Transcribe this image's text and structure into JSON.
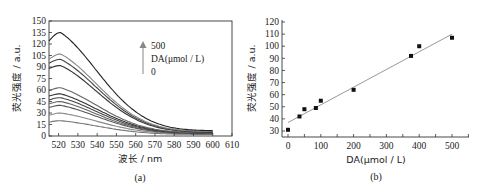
{
  "chart_data": [
    {
      "type": "line",
      "panel": "(a)",
      "xlabel": "波长 / nm",
      "ylabel": "荧光强度 / a.u.",
      "xlim": [
        515,
        610
      ],
      "ylim": [
        0,
        150
      ],
      "xticks": [
        520,
        530,
        540,
        550,
        560,
        570,
        580,
        590,
        600,
        610
      ],
      "yticks": [
        0,
        15,
        30,
        45,
        60,
        75,
        90,
        105,
        120,
        135,
        150
      ],
      "grid": false,
      "annotation": {
        "top": "500",
        "middle": "DA(μmol / L)",
        "bottom": "0",
        "arrow": "up"
      },
      "x_range_of_series": [
        515,
        600
      ],
      "peak_wavelength": 521,
      "series": [
        {
          "name": "0",
          "peak": 20,
          "end": 2,
          "start": 18,
          "color": "#777777"
        },
        {
          "name": "35",
          "peak": 30,
          "end": 2.5,
          "start": 27,
          "color": "#888888"
        },
        {
          "name": "50",
          "peak": 40,
          "end": 3,
          "start": 37,
          "color": "#555555"
        },
        {
          "name": "85",
          "peak": 45,
          "end": 3,
          "start": 42,
          "color": "#666666"
        },
        {
          "name": "100",
          "peak": 50,
          "end": 3.5,
          "start": 47,
          "color": "#444444"
        },
        {
          "name": "150",
          "peak": 55,
          "end": 4,
          "start": 52,
          "color": "#333333"
        },
        {
          "name": "200",
          "peak": 63,
          "end": 4,
          "start": 59,
          "color": "#666666"
        },
        {
          "name": "375",
          "peak": 92,
          "end": 5,
          "start": 88,
          "color": "#333333"
        },
        {
          "name": "400",
          "peak": 100,
          "end": 5.5,
          "start": 95,
          "color": "#444444"
        },
        {
          "name": "450",
          "peak": 107,
          "end": 6,
          "start": 100,
          "color": "#888888"
        },
        {
          "name": "500",
          "peak": 135,
          "end": 7,
          "start": 124,
          "color": "#222222"
        }
      ]
    },
    {
      "type": "scatter",
      "panel": "(b)",
      "xlabel": "DA(μmol / L)",
      "ylabel": "荧光强度 / a.u.",
      "xlim": [
        -10,
        560
      ],
      "ylim": [
        25,
        120
      ],
      "xticks": [
        0,
        100,
        200,
        300,
        400,
        500
      ],
      "yticks": [
        30,
        40,
        50,
        60,
        70,
        80,
        90,
        100,
        110,
        120
      ],
      "grid": false,
      "points": [
        {
          "x": 0,
          "y": 31
        },
        {
          "x": 35,
          "y": 42
        },
        {
          "x": 50,
          "y": 48
        },
        {
          "x": 85,
          "y": 49
        },
        {
          "x": 100,
          "y": 55
        },
        {
          "x": 200,
          "y": 64
        },
        {
          "x": 375,
          "y": 92
        },
        {
          "x": 400,
          "y": 100
        },
        {
          "x": 500,
          "y": 107
        }
      ],
      "fit_line": {
        "x0": 0,
        "y0": 37,
        "x1": 500,
        "y1": 110,
        "color": "#999999"
      }
    }
  ],
  "captions": {
    "a": "(a)",
    "b": "(b)"
  },
  "panel_a": {
    "ylabel": "荧光强度 / a.u.",
    "xlabel": "波长 / nm",
    "legend_top": "500",
    "legend_mid": "DA(μmol / L)",
    "legend_bot": "0"
  },
  "panel_b": {
    "ylabel": "荧光强度 / a.u.",
    "xlabel": "DA(μmol / L)"
  }
}
